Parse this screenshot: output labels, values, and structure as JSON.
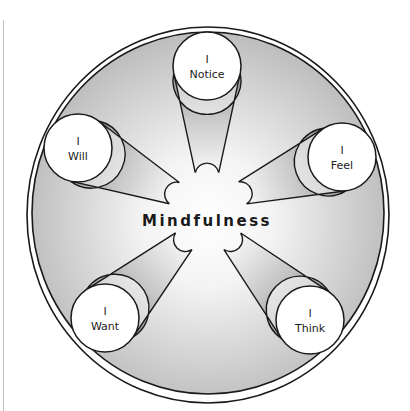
{
  "diagram": {
    "center_label": "Mindfulness",
    "nodes": [
      {
        "id": "notice",
        "line1": "I",
        "line2": "Notice",
        "cx": 207,
        "cy": 66,
        "tipx": 207,
        "tipy": 170
      },
      {
        "id": "feel",
        "line1": "I",
        "line2": "Feel",
        "cx": 342,
        "cy": 157,
        "tipx": 245,
        "tipy": 192
      },
      {
        "id": "think",
        "line1": "I",
        "line2": "Think",
        "cx": 310,
        "cy": 320,
        "tipx": 234,
        "tipy": 243
      },
      {
        "id": "want",
        "line1": "I",
        "line2": "Want",
        "cx": 105,
        "cy": 318,
        "tipx": 182,
        "tipy": 243
      },
      {
        "id": "will",
        "line1": "I",
        "line2": "Will",
        "cx": 78,
        "cy": 148,
        "tipx": 172,
        "tipy": 192
      }
    ],
    "colors": {
      "stroke": "#1a1a1a",
      "disc_edge": "#c2c2c2",
      "disc_center": "#ffffff",
      "petal_dark": "#8f8f8f",
      "petal_light": "#ffffff"
    }
  }
}
